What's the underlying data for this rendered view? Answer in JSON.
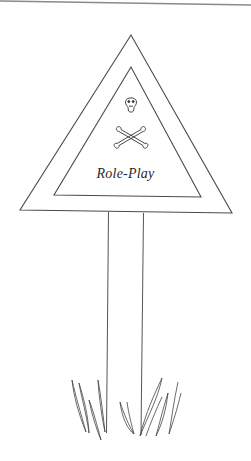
{
  "illustration": {
    "subject": "warning-road-sign",
    "sign_text": "Role-Play",
    "symbol": "skull-and-crossbones",
    "colors": {
      "background": "#ffffff",
      "line": "#4a4a4a",
      "top_rule": "#8a8a8a"
    }
  }
}
